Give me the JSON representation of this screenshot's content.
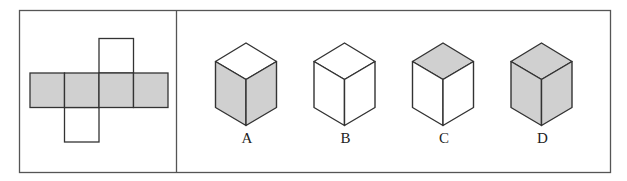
{
  "colors": {
    "shade": "#d0d0d0",
    "line": "#333333",
    "frame": "#555555",
    "white": "#ffffff"
  },
  "net": {
    "description": "cube net: row of four shaded squares, one white square above the third, one white square below the second",
    "row_squares": [
      {
        "x": 30,
        "y": 73,
        "shade": "#d0d0d0"
      },
      {
        "x": 64.5,
        "y": 73,
        "shade": "#d0d0d0"
      },
      {
        "x": 99,
        "y": 73,
        "shade": "#d0d0d0"
      },
      {
        "x": 133.5,
        "y": 73,
        "shade": "#d0d0d0"
      }
    ],
    "top_square": {
      "x": 99,
      "y": 38.5,
      "shade": "#ffffff"
    },
    "bottom_square": {
      "x": 64.5,
      "y": 107.5,
      "shade": "#ffffff"
    },
    "size": 34.5
  },
  "options": [
    {
      "label": "A",
      "cx": 246,
      "top": "#ffffff",
      "left": "#d0d0d0",
      "right": "#d0d0d0"
    },
    {
      "label": "B",
      "cx": 344.5,
      "top": "#ffffff",
      "left": "#ffffff",
      "right": "#ffffff"
    },
    {
      "label": "C",
      "cx": 443,
      "top": "#d0d0d0",
      "left": "#ffffff",
      "right": "#ffffff"
    },
    {
      "label": "D",
      "cx": 541.5,
      "top": "#d0d0d0",
      "left": "#d0d0d0",
      "right": "#d0d0d0"
    }
  ]
}
